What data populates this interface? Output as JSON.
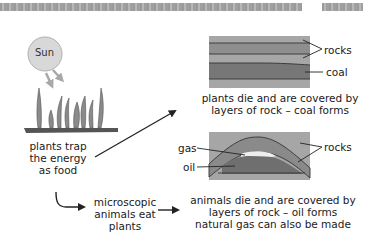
{
  "header": {
    "band_left": "decorative-texture-band",
    "band_right": "decorative-texture-band"
  },
  "sun": {
    "label": "Sun"
  },
  "plants": {
    "caption": [
      "plants trap",
      "the energy",
      "as food"
    ]
  },
  "microscopic": {
    "caption": [
      "microscopic",
      "animals eat",
      "plants"
    ]
  },
  "coal_panel": {
    "labels": {
      "rocks": "rocks",
      "coal": "coal"
    },
    "caption": [
      "plants die and are covered by",
      "layers of rock – coal forms"
    ]
  },
  "oil_panel": {
    "labels": {
      "gas": "gas",
      "oil": "oil",
      "rocks": "rocks"
    },
    "caption": [
      "animals die and are covered by",
      "layers of rock – oil forms",
      "natural gas can also be made"
    ]
  },
  "colors": {
    "rock_light": "#a6a6a6",
    "rock_mid": "#8c8c8c",
    "coal": "#6e6e6e",
    "gas": "#eeeeee",
    "sun": "#d6d6d6",
    "plant": "#8a8a8a",
    "ground": "#555555",
    "line": "#222222"
  }
}
